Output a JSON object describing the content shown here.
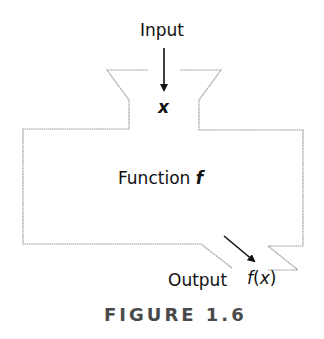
{
  "diagram": {
    "input_label": "Input",
    "input_variable": "x",
    "function_label": "Function",
    "function_symbol": "f",
    "output_label": "Output",
    "output_expression_fn": "f",
    "output_expression_open": "(",
    "output_expression_var": "x",
    "output_expression_close": ")",
    "caption": "FIGURE 1.6"
  },
  "colors": {
    "outline": "#9a9a9a",
    "arrow": "#111111",
    "text": "#111111",
    "caption": "#4a4a4a"
  }
}
